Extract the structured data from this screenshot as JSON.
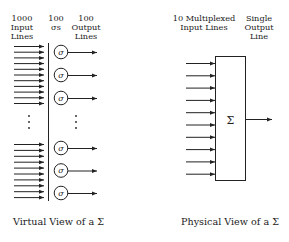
{
  "virtual_view": {
    "headers": {
      "inputs": "1000\nInput\nLines",
      "sigmas": "100\nσs",
      "outputs": "100\nOutput\nLines"
    },
    "sigma_symbol": "σ",
    "caption": "Virtual View of a Σ",
    "input_arrows_top_count": 11,
    "input_arrows_bottom_count": 10,
    "sigma_units_top_count": 3,
    "sigma_units_bottom_count": 3,
    "ellipsis": "⋮"
  },
  "physical_view": {
    "headers": {
      "inputs": "10 Multiplexed\nInput Lines",
      "output": "Single\nOutput\nLine"
    },
    "box_symbol": "Σ",
    "input_arrow_count": 10,
    "caption": "Physical View of a Σ"
  },
  "colors": {
    "stroke": "#222222",
    "background": "#ffffff"
  }
}
